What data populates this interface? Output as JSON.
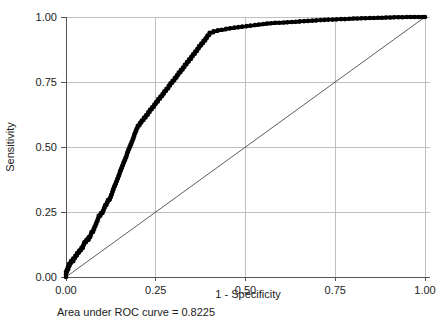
{
  "chart_data": {
    "type": "line",
    "title": "",
    "subtitle": "",
    "xlabel": "1 - Specificity",
    "ylabel": "Sensitivity",
    "xlim": [
      0.0,
      1.0
    ],
    "ylim": [
      0.0,
      1.0
    ],
    "grid": true,
    "legend": "none",
    "annotation": "Area under ROC curve = 0.8225",
    "auc": 0.8225,
    "xticks": [
      0.0,
      0.25,
      0.5,
      0.75,
      1.0
    ],
    "xtick_labels": [
      "0.00",
      "0.25",
      "0.50",
      "0.75",
      "1.00"
    ],
    "yticks": [
      0.0,
      0.25,
      0.5,
      0.75,
      1.0
    ],
    "ytick_labels": [
      "0.00",
      "0.25",
      "0.50",
      "0.75",
      "1.00"
    ],
    "series": [
      {
        "name": "ROC curve",
        "style": "step-markers",
        "color": "#000000",
        "x": [
          0.0,
          0.0,
          0.0,
          0.003,
          0.003,
          0.006,
          0.006,
          0.009,
          0.009,
          0.012,
          0.014,
          0.017,
          0.02,
          0.02,
          0.023,
          0.026,
          0.029,
          0.031,
          0.034,
          0.037,
          0.04,
          0.043,
          0.046,
          0.048,
          0.051,
          0.054,
          0.057,
          0.06,
          0.063,
          0.063,
          0.066,
          0.069,
          0.071,
          0.074,
          0.077,
          0.08,
          0.083,
          0.086,
          0.089,
          0.091,
          0.094,
          0.097,
          0.1,
          0.103,
          0.106,
          0.109,
          0.111,
          0.114,
          0.117,
          0.12,
          0.123,
          0.126,
          0.129,
          0.131,
          0.134,
          0.137,
          0.14,
          0.143,
          0.146,
          0.149,
          0.151,
          0.154,
          0.157,
          0.16,
          0.163,
          0.166,
          0.169,
          0.171,
          0.174,
          0.177,
          0.18,
          0.183,
          0.186,
          0.189,
          0.191,
          0.194,
          0.197,
          0.2,
          0.206,
          0.211,
          0.217,
          0.223,
          0.229,
          0.234,
          0.24,
          0.246,
          0.251,
          0.257,
          0.263,
          0.269,
          0.274,
          0.28,
          0.286,
          0.291,
          0.297,
          0.303,
          0.309,
          0.314,
          0.32,
          0.326,
          0.331,
          0.337,
          0.343,
          0.349,
          0.354,
          0.36,
          0.366,
          0.371,
          0.377,
          0.383,
          0.389,
          0.394,
          0.4,
          0.411,
          0.423,
          0.434,
          0.446,
          0.457,
          0.469,
          0.48,
          0.491,
          0.503,
          0.514,
          0.526,
          0.537,
          0.549,
          0.56,
          0.571,
          0.583,
          0.594,
          0.606,
          0.617,
          0.629,
          0.64,
          0.651,
          0.663,
          0.674,
          0.686,
          0.697,
          0.709,
          0.72,
          0.731,
          0.743,
          0.754,
          0.766,
          0.777,
          0.789,
          0.8,
          0.811,
          0.823,
          0.834,
          0.846,
          0.857,
          0.869,
          0.88,
          0.891,
          0.903,
          0.914,
          0.926,
          0.937,
          0.949,
          0.96,
          0.971,
          0.983,
          0.994,
          1.0
        ],
        "y": [
          0.0,
          0.01,
          0.02,
          0.02,
          0.03,
          0.03,
          0.041,
          0.041,
          0.051,
          0.051,
          0.061,
          0.061,
          0.061,
          0.071,
          0.071,
          0.082,
          0.082,
          0.092,
          0.092,
          0.102,
          0.102,
          0.112,
          0.112,
          0.122,
          0.133,
          0.133,
          0.143,
          0.143,
          0.143,
          0.153,
          0.153,
          0.163,
          0.173,
          0.173,
          0.184,
          0.194,
          0.204,
          0.214,
          0.224,
          0.235,
          0.235,
          0.245,
          0.245,
          0.255,
          0.265,
          0.276,
          0.276,
          0.286,
          0.296,
          0.296,
          0.306,
          0.316,
          0.327,
          0.337,
          0.347,
          0.357,
          0.367,
          0.378,
          0.388,
          0.398,
          0.408,
          0.418,
          0.429,
          0.439,
          0.449,
          0.459,
          0.469,
          0.48,
          0.49,
          0.5,
          0.51,
          0.52,
          0.531,
          0.541,
          0.551,
          0.561,
          0.571,
          0.582,
          0.592,
          0.602,
          0.612,
          0.622,
          0.633,
          0.643,
          0.653,
          0.663,
          0.673,
          0.684,
          0.694,
          0.704,
          0.714,
          0.724,
          0.735,
          0.745,
          0.755,
          0.765,
          0.776,
          0.786,
          0.796,
          0.806,
          0.816,
          0.827,
          0.837,
          0.847,
          0.857,
          0.867,
          0.878,
          0.888,
          0.898,
          0.908,
          0.918,
          0.929,
          0.939,
          0.945,
          0.949,
          0.951,
          0.955,
          0.957,
          0.959,
          0.961,
          0.963,
          0.965,
          0.967,
          0.969,
          0.971,
          0.973,
          0.975,
          0.976,
          0.978,
          0.978,
          0.979,
          0.98,
          0.981,
          0.982,
          0.983,
          0.984,
          0.985,
          0.986,
          0.987,
          0.988,
          0.989,
          0.99,
          0.99,
          0.991,
          0.992,
          0.992,
          0.993,
          0.994,
          0.994,
          0.995,
          0.995,
          0.996,
          0.996,
          0.997,
          0.997,
          0.998,
          0.998,
          0.999,
          0.999,
          0.999,
          1.0,
          1.0,
          1.0,
          1.0,
          1.0,
          1.0
        ]
      },
      {
        "name": "Reference diagonal",
        "style": "line",
        "color": "#333333",
        "x": [
          0.0,
          1.0
        ],
        "y": [
          0.0,
          1.0
        ]
      }
    ]
  },
  "figure": {
    "xlabel": "1 - Specificity",
    "ylabel": "Sensitivity",
    "caption": "Area under ROC curve = 0.8225"
  }
}
